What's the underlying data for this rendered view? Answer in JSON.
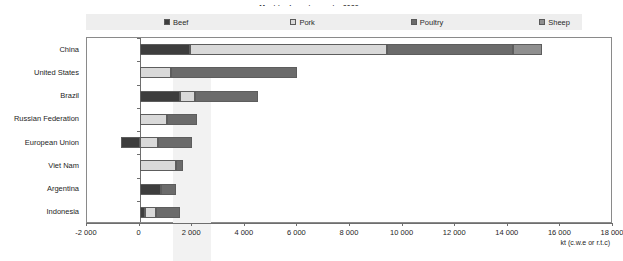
{
  "title": "Meat trade: net exports, 2029",
  "legend": {
    "items": [
      {
        "label": "Beef",
        "color": "#3d3d3d"
      },
      {
        "label": "Pork",
        "color": "#d9d9d9"
      },
      {
        "label": "Poultry",
        "color": "#6b6b6b"
      },
      {
        "label": "Sheep",
        "color": "#8f8f8f"
      }
    ]
  },
  "axis": {
    "unit_label": "kt (c.w.e or r.t.c)",
    "ticks": [
      "-2 000",
      "0",
      "2 000",
      "4 000",
      "6 000",
      "8 000",
      "10 000",
      "12 000",
      "14 000",
      "16 000",
      "18 000"
    ]
  },
  "chart_data": {
    "type": "bar",
    "orientation": "horizontal",
    "stacked": true,
    "title": "Meat trade: net exports, 2029",
    "xlabel": "kt (c.w.e or r.t.c)",
    "ylabel": "",
    "xlim": [
      -2000,
      18000
    ],
    "xtick_step": 2000,
    "grid": false,
    "legend_position": "top",
    "categories": [
      "China",
      "United States",
      "Brazil",
      "Russian Federation",
      "European Union",
      "Viet Nam",
      "Argentina",
      "Indonesia"
    ],
    "series": [
      {
        "name": "Beef",
        "color": "#3d3d3d",
        "values": [
          1900,
          0,
          1550,
          0,
          -700,
          0,
          800,
          220
        ]
      },
      {
        "name": "Pork",
        "color": "#d9d9d9",
        "values": [
          7500,
          1200,
          550,
          1050,
          700,
          1400,
          0,
          420
        ]
      },
      {
        "name": "Poultry",
        "color": "#6b6b6b",
        "values": [
          4800,
          4800,
          2400,
          1150,
          1300,
          250,
          600,
          910
        ]
      },
      {
        "name": "Sheep",
        "color": "#8f8f8f",
        "values": [
          1100,
          0,
          0,
          0,
          0,
          0,
          0,
          0
        ]
      }
    ],
    "totals_positive": [
      15300,
      6000,
      4500,
      2200,
      2000,
      1650,
      1400,
      1550
    ]
  }
}
